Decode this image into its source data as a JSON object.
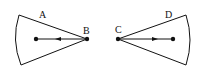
{
  "diagram": {
    "left_sector": {
      "label_top": "A",
      "label_apex": "B",
      "arrow_direction": "left"
    },
    "right_sector": {
      "label_apex": "C",
      "label_top": "D",
      "arrow_direction": "right"
    },
    "colors": {
      "line": "#111111",
      "background": "#ffffff"
    }
  }
}
